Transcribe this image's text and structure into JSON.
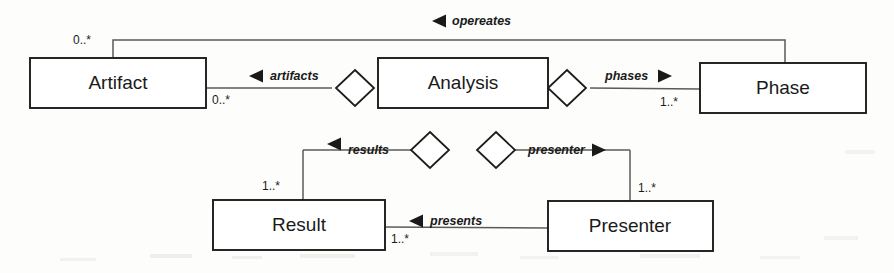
{
  "diagram": {
    "type": "uml-class-diagram",
    "background_color": "#fdfdfc",
    "line_color": "#5a5a5a",
    "box_border_color": "#1c1c1c",
    "text_color": "#1a1a1a",
    "classes": [
      {
        "id": "artifact",
        "name": "Artifact",
        "x": 30,
        "y": 58,
        "w": 176,
        "h": 50
      },
      {
        "id": "analysis",
        "name": "Analysis",
        "x": 378,
        "y": 58,
        "w": 170,
        "h": 50
      },
      {
        "id": "phase",
        "name": "Phase",
        "x": 700,
        "y": 63,
        "w": 166,
        "h": 50
      },
      {
        "id": "result",
        "name": "Result",
        "x": 213,
        "y": 200,
        "w": 172,
        "h": 50
      },
      {
        "id": "presenter",
        "name": "Presenter",
        "x": 548,
        "y": 201,
        "w": 165,
        "h": 50
      }
    ],
    "associations": [
      {
        "id": "opereates",
        "role": "opereates",
        "direction": "left",
        "source": "phase",
        "target": "artifact",
        "source_multiplicity": "",
        "target_multiplicity": "0..*",
        "aggregation": "none"
      },
      {
        "id": "artifacts",
        "role": "artifacts",
        "direction": "left",
        "source": "analysis",
        "target": "artifact",
        "source_multiplicity": "",
        "target_multiplicity": "0..*",
        "aggregation": "shared"
      },
      {
        "id": "phases",
        "role": "phases",
        "direction": "right",
        "source": "analysis",
        "target": "phase",
        "source_multiplicity": "",
        "target_multiplicity": "1..*",
        "aggregation": "shared"
      },
      {
        "id": "results",
        "role": "results",
        "direction": "left",
        "source": "analysis",
        "target": "result",
        "source_multiplicity": "",
        "target_multiplicity": "1..*",
        "aggregation": "shared"
      },
      {
        "id": "presenter",
        "role": "presenter",
        "direction": "right",
        "source": "analysis",
        "target": "presenter",
        "source_multiplicity": "",
        "target_multiplicity": "1..*",
        "aggregation": "shared"
      },
      {
        "id": "presents",
        "role": "presents",
        "direction": "left",
        "source": "presenter",
        "target": "result",
        "source_multiplicity": "",
        "target_multiplicity": "1..*",
        "aggregation": "none"
      }
    ],
    "labels": {
      "artifact_name": "Artifact",
      "analysis_name": "Analysis",
      "phase_name": "Phase",
      "result_name": "Result",
      "presenter_name": "Presenter",
      "role_opereates": "opereates",
      "role_artifacts": "artifacts",
      "role_phases": "phases",
      "role_results": "results",
      "role_presenter": "presenter",
      "role_presents": "presents",
      "mult_opereates_artifact": "0..*",
      "mult_artifacts_artifact": "0..*",
      "mult_phases_phase": "1..*",
      "mult_results_result": "1..*",
      "mult_presenter_presenter": "1..*",
      "mult_presents_result": "1..*"
    }
  }
}
